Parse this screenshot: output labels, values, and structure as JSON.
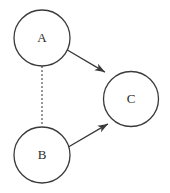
{
  "diagram": {
    "type": "node-edge-graph",
    "background_color": "#ffffff",
    "stroke_color": "#3a3a3a",
    "label_color": "#2b2b2b",
    "canvas": {
      "width": 170,
      "height": 193
    },
    "nodes": [
      {
        "id": "A",
        "label": "A",
        "cx": 42,
        "cy": 38,
        "r": 28,
        "fill": "#ffffff",
        "stroke": "#3a3a3a",
        "stroke_width": 1.3,
        "font_size": 13
      },
      {
        "id": "C",
        "label": "C",
        "cx": 131,
        "cy": 99,
        "r": 27.5,
        "fill": "#ffffff",
        "stroke": "#3a3a3a",
        "stroke_width": 1.3,
        "font_size": 13
      },
      {
        "id": "B",
        "label": "B",
        "cx": 42,
        "cy": 155,
        "r": 28,
        "fill": "#ffffff",
        "stroke": "#3a3a3a",
        "stroke_width": 1.3,
        "font_size": 13
      }
    ],
    "edges": [
      {
        "id": "a-to-c",
        "from": "A",
        "to": "C",
        "style": "solid",
        "arrow": "end",
        "x1": 66.5,
        "y1": 49.5,
        "x2": 106.5,
        "y2": 73.0,
        "stroke_width": 1.4
      },
      {
        "id": "b-to-c",
        "from": "B",
        "to": "C",
        "style": "solid",
        "arrow": "end",
        "x1": 67.5,
        "y1": 147.5,
        "x2": 109.5,
        "y2": 123.0,
        "stroke_width": 1.4
      },
      {
        "id": "a-to-b",
        "from": "A",
        "to": "B",
        "style": "dotted",
        "arrow": "none",
        "x1": 42,
        "y1": 66.5,
        "x2": 42,
        "y2": 126.5,
        "stroke_width": 1.2,
        "dash_pattern": "1 3"
      }
    ]
  }
}
